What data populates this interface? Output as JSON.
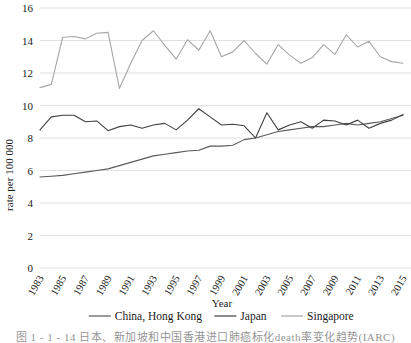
{
  "figure": {
    "caption": "图 1 - 1 - 14    日本、新加坡和中国香港进口肺癌标化death率变化趋势(IARC)"
  },
  "chart_data": {
    "type": "line",
    "title": "",
    "xlabel": "Year",
    "ylabel": "rate per 100 000",
    "ylim": [
      0,
      16
    ],
    "ytick_step": 2,
    "yticks": [
      "0",
      "2",
      "4",
      "6",
      "8",
      "10",
      "12",
      "14",
      "16"
    ],
    "grid": "horizontal",
    "legend_position": "bottom",
    "x": [
      1983,
      1984,
      1985,
      1986,
      1987,
      1988,
      1989,
      1990,
      1991,
      1992,
      1993,
      1994,
      1995,
      1996,
      1997,
      1998,
      1999,
      2000,
      2001,
      2002,
      2003,
      2004,
      2005,
      2006,
      2007,
      2008,
      2009,
      2010,
      2011,
      2012,
      2013,
      2014,
      2015
    ],
    "xticks": [
      "1983",
      "1985",
      "1987",
      "1989",
      "1991",
      "1993",
      "1995",
      "1997",
      "1999",
      "2001",
      "2003",
      "2005",
      "2007",
      "2009",
      "2011",
      "2013",
      "2015"
    ],
    "series": [
      {
        "name": "China, Hong Kong",
        "color": "#595959",
        "values": [
          5.6,
          5.65,
          5.7,
          5.8,
          5.9,
          6.0,
          6.1,
          6.3,
          6.5,
          6.7,
          6.9,
          7.0,
          7.1,
          7.2,
          7.25,
          7.5,
          7.5,
          7.55,
          7.9,
          8.0,
          8.2,
          8.4,
          8.5,
          8.6,
          8.7,
          8.7,
          8.8,
          8.9,
          8.8,
          8.9,
          9.0,
          9.2,
          9.4
        ]
      },
      {
        "name": "Japan",
        "color": "#404040",
        "values": [
          8.5,
          9.3,
          9.4,
          9.4,
          9.0,
          9.05,
          8.45,
          8.7,
          8.8,
          8.6,
          8.8,
          8.9,
          8.5,
          9.1,
          9.8,
          9.3,
          8.8,
          8.85,
          8.75,
          8.0,
          9.55,
          8.5,
          8.8,
          9.0,
          8.6,
          9.1,
          9.05,
          8.8,
          9.1,
          8.6,
          8.9,
          9.1,
          9.45
        ]
      },
      {
        "name": "Singapore",
        "color": "#a6a6a6",
        "values": [
          11.1,
          11.3,
          14.2,
          14.25,
          14.1,
          14.45,
          14.5,
          11.05,
          12.6,
          14.0,
          14.6,
          13.7,
          12.85,
          14.05,
          13.4,
          14.6,
          13.0,
          13.3,
          14.0,
          13.2,
          12.55,
          13.75,
          13.1,
          12.6,
          12.95,
          13.75,
          13.15,
          14.35,
          13.6,
          13.95,
          13.0,
          12.7,
          12.6
        ]
      }
    ]
  },
  "legend": {
    "items": [
      {
        "label": "China, Hong Kong"
      },
      {
        "label": "Japan"
      },
      {
        "label": "Singapore"
      }
    ]
  }
}
